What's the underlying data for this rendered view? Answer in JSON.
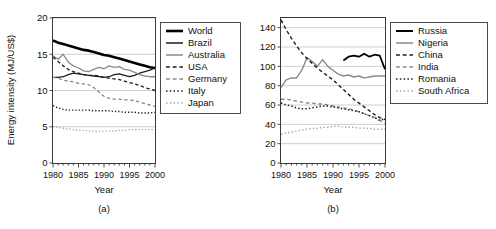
{
  "figure": {
    "panels": [
      {
        "caption": "(a)",
        "ylabel": "Energy intensity (MJ/US$)",
        "xlabel": "Year"
      },
      {
        "caption": "(b)",
        "ylabel": "Energy intensity (MJ/US$)",
        "xlabel": "Year"
      }
    ]
  },
  "chart_data": [
    {
      "type": "line",
      "title": "",
      "xlabel": "Year",
      "ylabel": "Energy intensity (MJ/US$)",
      "caption": "(a)",
      "xlim": [
        1980,
        2000
      ],
      "ylim": [
        0,
        20
      ],
      "xticks": [
        1980,
        1985,
        1990,
        1995,
        2000
      ],
      "yticks": [
        0,
        5,
        10,
        15,
        20
      ],
      "xticklabels": [
        "1980",
        "1985",
        "1990",
        "1995",
        "2000"
      ],
      "yticklabels": [
        "0",
        "5",
        "10",
        "15",
        "20"
      ],
      "grid": "horizontal",
      "legend_position": "right-outside",
      "x": [
        1980,
        1981,
        1982,
        1983,
        1984,
        1985,
        1986,
        1987,
        1988,
        1989,
        1990,
        1991,
        1992,
        1993,
        1994,
        1995,
        1996,
        1997,
        1998,
        1999,
        2000
      ],
      "series": [
        {
          "name": "World",
          "color": "#000000",
          "style": "solid",
          "width": 2.6,
          "values": [
            16.9,
            16.6,
            16.4,
            16.2,
            16.0,
            15.8,
            15.6,
            15.5,
            15.3,
            15.1,
            14.9,
            14.8,
            14.6,
            14.4,
            14.2,
            14.0,
            13.8,
            13.6,
            13.4,
            13.2,
            13.1
          ]
        },
        {
          "name": "Brazil",
          "color": "#1c1c1c",
          "style": "solid",
          "width": 1.3,
          "values": [
            11.8,
            11.8,
            11.9,
            12.2,
            12.4,
            12.3,
            12.2,
            12.1,
            12.0,
            11.9,
            11.8,
            11.9,
            12.2,
            12.3,
            12.1,
            11.9,
            12.1,
            12.4,
            12.6,
            12.8,
            13.1
          ]
        },
        {
          "name": "Australia",
          "color": "#8a8a8a",
          "style": "solid",
          "width": 1.3,
          "values": [
            14.8,
            14.3,
            15.0,
            13.9,
            13.4,
            13.1,
            12.7,
            12.6,
            12.9,
            13.2,
            13.0,
            13.4,
            13.2,
            13.3,
            12.9,
            12.8,
            12.5,
            12.2,
            12.0,
            11.9,
            11.9
          ]
        },
        {
          "name": "USA",
          "color": "#1c1c1c",
          "style": "dashed",
          "width": 1.3,
          "values": [
            14.6,
            14.0,
            13.4,
            12.9,
            12.6,
            12.4,
            12.2,
            12.1,
            12.1,
            12.0,
            11.8,
            11.7,
            11.6,
            11.5,
            11.3,
            11.1,
            10.9,
            10.7,
            10.4,
            10.2,
            10.0
          ]
        },
        {
          "name": "Germany",
          "color": "#8a8a8a",
          "style": "dashed",
          "width": 1.3,
          "values": [
            11.8,
            11.7,
            11.4,
            11.3,
            11.2,
            11.0,
            10.9,
            10.8,
            10.4,
            9.8,
            9.2,
            8.9,
            8.8,
            8.8,
            8.7,
            8.7,
            8.6,
            8.4,
            8.2,
            8.0,
            7.8
          ]
        },
        {
          "name": "Italy",
          "color": "#1c1c1c",
          "style": "dotted",
          "width": 1.4,
          "values": [
            7.9,
            7.6,
            7.4,
            7.3,
            7.3,
            7.3,
            7.3,
            7.3,
            7.2,
            7.2,
            7.2,
            7.2,
            7.1,
            7.1,
            7.0,
            7.0,
            7.0,
            6.9,
            6.9,
            6.9,
            7.0
          ]
        },
        {
          "name": "Japan",
          "color": "#a8a8a8",
          "style": "dotted",
          "width": 1.4,
          "values": [
            5.0,
            4.9,
            4.8,
            4.7,
            4.6,
            4.5,
            4.5,
            4.4,
            4.4,
            4.4,
            4.4,
            4.4,
            4.4,
            4.5,
            4.5,
            4.6,
            4.6,
            4.6,
            4.6,
            4.6,
            4.6
          ]
        }
      ]
    },
    {
      "type": "line",
      "title": "",
      "xlabel": "Year",
      "ylabel": "Energy intensity (MJ/US$)",
      "caption": "(b)",
      "xlim": [
        1980,
        2000
      ],
      "ylim": [
        0,
        150
      ],
      "xticks": [
        1980,
        1985,
        1990,
        1995,
        2000
      ],
      "yticks": [
        0,
        20,
        40,
        60,
        80,
        100,
        120,
        140
      ],
      "xticklabels": [
        "1980",
        "1985",
        "1990",
        "1995",
        "2000"
      ],
      "yticklabels": [
        "0",
        "20",
        "40",
        "60",
        "80",
        "100",
        "120",
        "140"
      ],
      "grid": "horizontal",
      "legend_position": "right-outside",
      "x": [
        1980,
        1981,
        1982,
        1983,
        1984,
        1985,
        1986,
        1987,
        1988,
        1989,
        1990,
        1991,
        1992,
        1993,
        1994,
        1995,
        1996,
        1997,
        1998,
        1999,
        2000
      ],
      "series": [
        {
          "name": "Russia",
          "color": "#000000",
          "style": "solid",
          "width": 1.8,
          "start_year": 1992,
          "values": [
            null,
            null,
            null,
            null,
            null,
            null,
            null,
            null,
            null,
            null,
            null,
            null,
            106,
            110,
            111,
            110,
            113,
            110,
            112,
            111,
            97
          ]
        },
        {
          "name": "Nigeria",
          "color": "#8a8a8a",
          "style": "solid",
          "width": 1.4,
          "values": [
            78,
            86,
            88,
            88,
            96,
            109,
            105,
            100,
            107,
            100,
            96,
            92,
            90,
            91,
            89,
            90,
            88,
            89,
            90,
            90,
            90
          ]
        },
        {
          "name": "China",
          "color": "#1c1c1c",
          "style": "dashed",
          "width": 1.4,
          "values": [
            148,
            138,
            129,
            121,
            114,
            108,
            103,
            98,
            94,
            90,
            86,
            81,
            76,
            71,
            66,
            62,
            58,
            54,
            50,
            47,
            45
          ]
        },
        {
          "name": "India",
          "color": "#8a8a8a",
          "style": "dashed",
          "width": 1.4,
          "values": [
            66,
            66,
            65,
            64,
            63,
            62,
            62,
            61,
            61,
            60,
            59,
            58,
            57,
            56,
            55,
            53,
            51,
            49,
            47,
            44,
            41
          ]
        },
        {
          "name": "Romania",
          "color": "#1c1c1c",
          "style": "dotted",
          "width": 1.5,
          "values": [
            62,
            60,
            59,
            57,
            56,
            56,
            57,
            58,
            59,
            59,
            58,
            57,
            56,
            55,
            54,
            53,
            51,
            49,
            47,
            44,
            46
          ]
        },
        {
          "name": "South Africa",
          "color": "#a8a8a8",
          "style": "dotted",
          "width": 1.5,
          "values": [
            30,
            31,
            32,
            33,
            34,
            35,
            36,
            36,
            37,
            37,
            38,
            38,
            37,
            37,
            37,
            36,
            36,
            36,
            35,
            35,
            35
          ]
        }
      ]
    }
  ],
  "legends": [
    {
      "panel": "a",
      "entries": [
        {
          "label": "World",
          "color": "#000000",
          "style": "solid",
          "width": 2.6
        },
        {
          "label": "Brazil",
          "color": "#1c1c1c",
          "style": "solid",
          "width": 1.5
        },
        {
          "label": "Australia",
          "color": "#8a8a8a",
          "style": "solid",
          "width": 1.5
        },
        {
          "label": "USA",
          "color": "#1c1c1c",
          "style": "dashed",
          "width": 1.5
        },
        {
          "label": "Germany",
          "color": "#8a8a8a",
          "style": "dashed",
          "width": 1.5
        },
        {
          "label": "Italy",
          "color": "#1c1c1c",
          "style": "dotted",
          "width": 1.6
        },
        {
          "label": "Japan",
          "color": "#a8a8a8",
          "style": "dotted",
          "width": 1.6
        }
      ]
    },
    {
      "panel": "b",
      "entries": [
        {
          "label": "Russia",
          "color": "#000000",
          "style": "solid",
          "width": 2.0
        },
        {
          "label": "Nigeria",
          "color": "#8a8a8a",
          "style": "solid",
          "width": 1.5
        },
        {
          "label": "China",
          "color": "#1c1c1c",
          "style": "dashed",
          "width": 1.5
        },
        {
          "label": "India",
          "color": "#8a8a8a",
          "style": "dashed",
          "width": 1.5
        },
        {
          "label": "Romania",
          "color": "#1c1c1c",
          "style": "dotted",
          "width": 1.6
        },
        {
          "label": "South Africa",
          "color": "#a8a8a8",
          "style": "dotted",
          "width": 1.6
        }
      ]
    }
  ]
}
